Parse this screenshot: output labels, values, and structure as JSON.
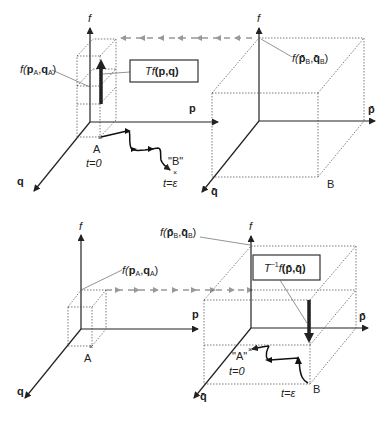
{
  "figure": {
    "top_panel": {
      "left_system": {
        "axis_labels": {
          "f": "f",
          "p": "p",
          "q": "q"
        },
        "point_label": "A",
        "time_label": "t=0",
        "value_label": {
          "prefix": "f(",
          "p": "p",
          "p_sub": "A",
          "sep": ",",
          "q": "q",
          "q_sub": "A",
          "suffix": ")"
        },
        "operator_box": {
          "op": "Tf",
          "args": "(p,q)"
        },
        "trajectory_end_label": "\"B\"",
        "trajectory_end_time": "t=ε"
      },
      "right_system": {
        "axis_labels": {
          "f": "f",
          "p": "p̄",
          "q": "q̄"
        },
        "point_label": "B",
        "value_label": {
          "prefix": "f(",
          "p": "p̄",
          "p_sub": "B",
          "sep": ",",
          "q": "q̄",
          "q_sub": "B",
          "suffix": ")"
        }
      }
    },
    "bottom_panel": {
      "left_system": {
        "axis_labels": {
          "f": "f",
          "p": "p",
          "q": "q"
        },
        "point_label": "A",
        "value_label": {
          "prefix": "f(",
          "p": "p",
          "p_sub": "A",
          "sep": ",",
          "q": "q",
          "q_sub": "A",
          "suffix": ")"
        }
      },
      "right_system": {
        "axis_labels": {
          "f": "f",
          "p": "p̄",
          "q": "q̄"
        },
        "point_label": "B",
        "time_label": "t=ε",
        "value_label": {
          "prefix": "f(",
          "p": "p̄",
          "p_sub": "B",
          "sep": ",",
          "q": "q̄",
          "q_sub": "B",
          "suffix": ")"
        },
        "operator_box": {
          "op": "T",
          "sup": "−1",
          "op2": "f",
          "args": "(p̄,q̄)"
        },
        "trajectory_end_label": "\"A\"",
        "trajectory_end_time": "t=0"
      }
    }
  }
}
